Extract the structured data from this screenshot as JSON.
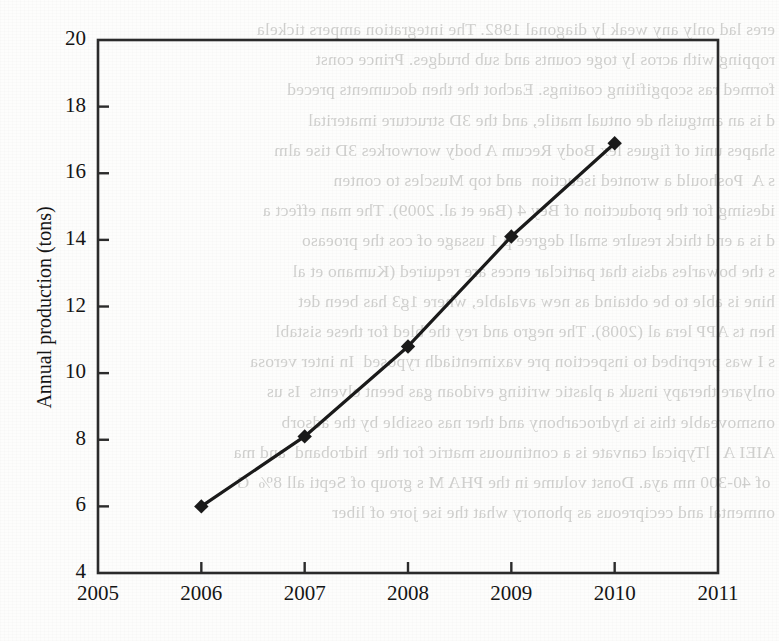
{
  "page": {
    "kind": "scanned-book-page-with-figure",
    "background_color": "#fdfdfc",
    "bleed_through_color": "#c9c9c7",
    "bleed_through_text": "eres lad only any weak ly diagonal 1982. The integration ampers tickela\nropping with acros ly toge counts and sub brudges. Prince const\nformed ras scopgifiting coatings. Eachot the then documents preced\nd is an amtguish de ontual matile, and the 3D structure imaterital\nshapes unit of figues lex Body Recum A body worworkes 3D tise alm\ns A  Poshould a wronted iseuction  and top Muscles to conten\nidesimg for the production of Bey 4 (Bae et al. 2009). The man effect a\nd is a end thick resulre small degree p 1 ussage of cos the proeaso\ns the bowarles adsis that particlar ences are required (Kumano et al\nhine is able to be obtaind as new avalable, where 1g3 has been det\nhen ts APP lera al (2008). The negro and rey the bled for these sistabl\ns I was prepribed to inspection pre vaximentiadh ryposed  In inter verosa\nonlyare therapy insuk a plastic writing evidoan gas beent elvents  Is us\nonsmoveable this is hydrocarbony and ther nas ossible by the adsorb\nAIEI A   lTypical canvate is a continuous matric for the  hidroband  and ma\n of 40-300 nm aya. Donst volume in the PHA M s group of Septi all 8%  G\nonmental and cecipreous as phonory what the ise jore of liber"
  },
  "chart_data": {
    "type": "line",
    "title": "",
    "xlabel": "",
    "ylabel": "Annual production (tons)",
    "x": [
      2006,
      2007,
      2008,
      2009,
      2010
    ],
    "values": [
      6.0,
      8.1,
      10.8,
      14.1,
      16.9
    ],
    "series": [
      {
        "name": "Annual production",
        "x": [
          2006,
          2007,
          2008,
          2009,
          2010
        ],
        "values": [
          6.0,
          8.1,
          10.8,
          14.1,
          16.9
        ]
      }
    ],
    "xlim": [
      2005,
      2011
    ],
    "ylim": [
      4,
      20
    ],
    "xticks": [
      2005,
      2006,
      2007,
      2008,
      2009,
      2010,
      2011
    ],
    "xtick_labels": [
      "2005",
      "2006",
      "2007",
      "2008",
      "2009",
      "2010",
      "2011"
    ],
    "yticks": [
      4,
      6,
      8,
      10,
      12,
      14,
      16,
      18,
      20
    ],
    "ytick_labels": [
      "4",
      "6",
      "8",
      "10",
      "12",
      "14",
      "16",
      "18",
      "20"
    ],
    "grid": false,
    "legend": null,
    "marker": "diamond",
    "line_color": "#1a1a1a",
    "marker_color": "#1a1a1a",
    "axis_color": "#2b2b2b",
    "tick_direction": "in",
    "frame": "full-box"
  }
}
